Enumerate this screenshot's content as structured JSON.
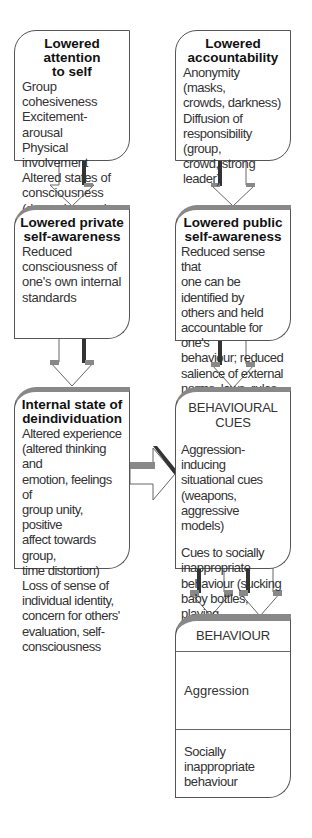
{
  "diagram": {
    "type": "flowchart",
    "boxes": {
      "attention": {
        "title": "Lowered attention to self",
        "title_lines": [
          "Lowered attention",
          "to self"
        ],
        "lines": [
          "Group cohesiveness",
          "Excitement-arousal",
          "Physical involvement",
          "Altered states of",
          "consciousness",
          "(drugs, hypnosis,",
          "chanting)"
        ]
      },
      "accountability": {
        "title": "Lowered accountability",
        "title_lines": [
          "Lowered",
          "accountability"
        ],
        "lines": [
          "Anonymity (masks,",
          "crowds, darkness)",
          "Diffusion of",
          "responsibility (group,",
          "crowd, strong leader)"
        ]
      },
      "private": {
        "title": "Lowered private self-awareness",
        "title_lines": [
          "Lowered private",
          "self-awareness"
        ],
        "lines": [
          "Reduced",
          "consciousness of",
          "one's own internal",
          "standards"
        ]
      },
      "public": {
        "title": "Lowered public self-awareness",
        "title_lines": [
          "Lowered public",
          "self-awareness"
        ],
        "lines": [
          "Reduced sense that",
          "one can be identified by",
          "others and held",
          "accountable for one's",
          "behaviour; reduced",
          "salience of external",
          "norms, laws, rules"
        ]
      },
      "internal": {
        "title": "Internal state of deindividuation",
        "title_lines": [
          "Internal state of",
          "deindividuation"
        ],
        "lines": [
          "Altered experience",
          "(altered thinking and",
          "emotion, feelings of",
          "group unity, positive",
          "affect towards group,",
          "time distortion)",
          "Loss of sense of",
          "individual identity,",
          "concern for others'",
          "evaluation, self-",
          "consciousness"
        ]
      },
      "cues": {
        "title": "BEHAVIOURAL CUES",
        "group1": [
          "Aggression-inducing",
          "situational cues",
          "(weapons, aggressive",
          "models)"
        ],
        "group2": [
          "Cues to socially",
          "inappropriate",
          "behaviour (sucking",
          "baby bottles, playing",
          "in mud, writing",
          "obscenities)"
        ]
      },
      "behaviour": {
        "title": "BEHAVIOUR",
        "rows": [
          "Aggression",
          "Socially inappropriate behaviour"
        ],
        "row2_lines": [
          "Socially inappropriate",
          "behaviour"
        ]
      }
    },
    "edges": [
      {
        "from": "Lowered attention to self",
        "to": "Lowered private self-awareness"
      },
      {
        "from": "Lowered accountability",
        "to": "Lowered public self-awareness"
      },
      {
        "from": "Lowered private self-awareness",
        "to": "Internal state of deindividuation"
      },
      {
        "from": "Lowered public self-awareness",
        "to": "BEHAVIOURAL CUES"
      },
      {
        "from": "Internal state of deindividuation",
        "to": "BEHAVIOURAL CUES"
      },
      {
        "from": "BEHAVIOURAL CUES",
        "to": "BEHAVIOUR"
      }
    ],
    "colors": {
      "border": "#555555",
      "arrow_shade": "#888888",
      "arrow_dark": "#333333",
      "text": "#333333"
    }
  }
}
